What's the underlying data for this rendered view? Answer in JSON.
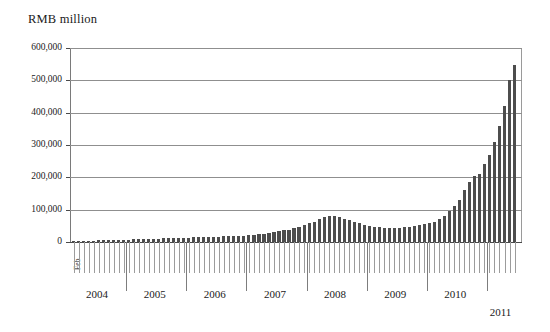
{
  "chart_data": {
    "type": "bar",
    "title": "RMB million",
    "xlabel": "",
    "ylabel": "RMB million",
    "ylim": [
      0,
      600000
    ],
    "ytick_labels": [
      "600,000",
      "500,000",
      "400,000",
      "300,000",
      "200,000",
      "100,000",
      "0"
    ],
    "ytick_values": [
      600000,
      500000,
      400000,
      300000,
      200000,
      100000,
      0
    ],
    "grid": true,
    "legend": null,
    "first_period_label": "Feb",
    "year_labels": [
      "2004",
      "2005",
      "2006",
      "2007",
      "2008",
      "2009",
      "2010",
      "2011"
    ],
    "bar_color": "#4d4d4d",
    "categories": [
      "2004-02",
      "2004-03",
      "2004-04",
      "2004-05",
      "2004-06",
      "2004-07",
      "2004-08",
      "2004-09",
      "2004-10",
      "2004-11",
      "2004-12",
      "2005-01",
      "2005-02",
      "2005-03",
      "2005-04",
      "2005-05",
      "2005-06",
      "2005-07",
      "2005-08",
      "2005-09",
      "2005-10",
      "2005-11",
      "2005-12",
      "2006-01",
      "2006-02",
      "2006-03",
      "2006-04",
      "2006-05",
      "2006-06",
      "2006-07",
      "2006-08",
      "2006-09",
      "2006-10",
      "2006-11",
      "2006-12",
      "2007-01",
      "2007-02",
      "2007-03",
      "2007-04",
      "2007-05",
      "2007-06",
      "2007-07",
      "2007-08",
      "2007-09",
      "2007-10",
      "2007-11",
      "2007-12",
      "2008-01",
      "2008-02",
      "2008-03",
      "2008-04",
      "2008-05",
      "2008-06",
      "2008-07",
      "2008-08",
      "2008-09",
      "2008-10",
      "2008-11",
      "2008-12",
      "2009-01",
      "2009-02",
      "2009-03",
      "2009-04",
      "2009-05",
      "2009-06",
      "2009-07",
      "2009-08",
      "2009-09",
      "2009-10",
      "2009-11",
      "2009-12",
      "2010-01",
      "2010-02",
      "2010-03",
      "2010-04",
      "2010-05",
      "2010-06",
      "2010-07",
      "2010-08",
      "2010-09",
      "2010-10",
      "2010-11",
      "2010-12",
      "2011-01",
      "2011-02",
      "2011-03",
      "2011-04",
      "2011-05",
      "2011-06"
    ],
    "values": [
      3000,
      3500,
      4000,
      4200,
      4500,
      5000,
      5200,
      5500,
      6000,
      6500,
      7000,
      7500,
      8000,
      8500,
      9000,
      9500,
      10000,
      10500,
      11000,
      11500,
      12000,
      12500,
      13000,
      13500,
      14000,
      14500,
      15000,
      16000,
      16500,
      17000,
      17500,
      18000,
      19000,
      19500,
      20000,
      21000,
      22000,
      24000,
      26000,
      28000,
      30000,
      33000,
      36000,
      38000,
      42000,
      46000,
      52000,
      58000,
      62000,
      70000,
      78000,
      80000,
      79000,
      76000,
      72000,
      68000,
      63000,
      58000,
      54000,
      50000,
      47000,
      45000,
      44000,
      43000,
      43500,
      44000,
      45000,
      47000,
      49000,
      52000,
      55000,
      58000,
      62000,
      70000,
      82000,
      95000,
      110000,
      130000,
      160000,
      185000,
      205000,
      210000,
      240000,
      270000,
      310000,
      360000,
      420000,
      500000,
      548000
    ]
  }
}
